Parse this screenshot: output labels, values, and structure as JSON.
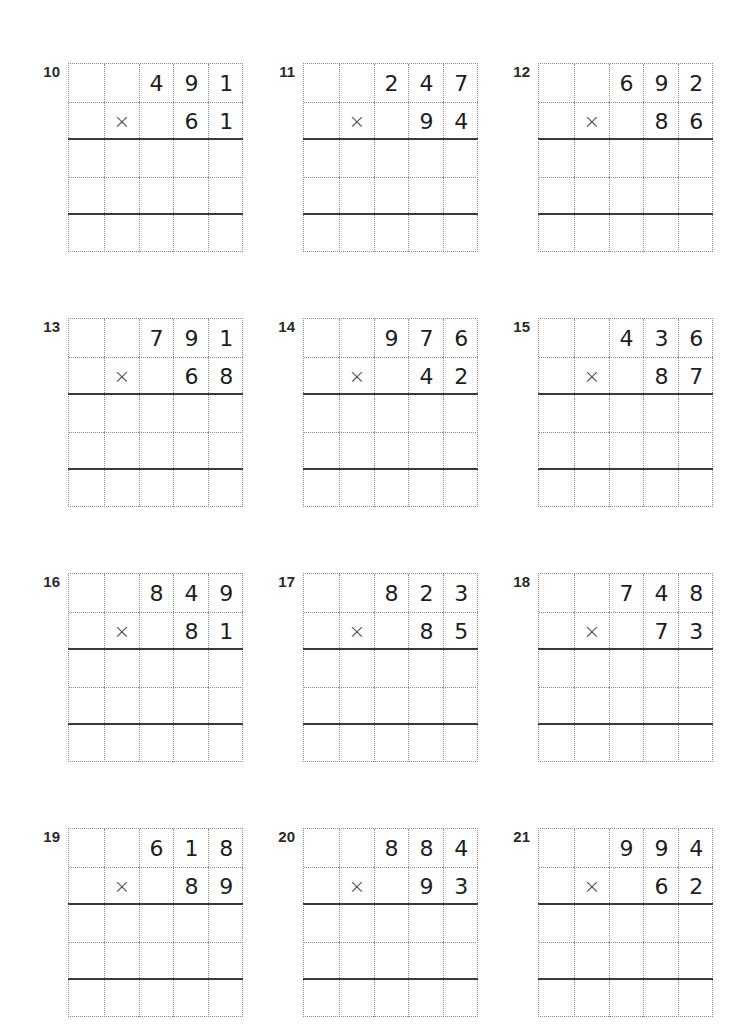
{
  "worksheet": {
    "operator_symbol": "×",
    "grid": {
      "columns": 5,
      "rows": 5,
      "solid_line_after_rows": [
        2,
        4
      ]
    },
    "problems": [
      {
        "number": "10",
        "multiplicand": [
          "4",
          "9",
          "1"
        ],
        "multiplier": [
          "6",
          "1"
        ]
      },
      {
        "number": "11",
        "multiplicand": [
          "2",
          "4",
          "7"
        ],
        "multiplier": [
          "9",
          "4"
        ]
      },
      {
        "number": "12",
        "multiplicand": [
          "6",
          "9",
          "2"
        ],
        "multiplier": [
          "8",
          "6"
        ]
      },
      {
        "number": "13",
        "multiplicand": [
          "7",
          "9",
          "1"
        ],
        "multiplier": [
          "6",
          "8"
        ]
      },
      {
        "number": "14",
        "multiplicand": [
          "9",
          "7",
          "6"
        ],
        "multiplier": [
          "4",
          "2"
        ]
      },
      {
        "number": "15",
        "multiplicand": [
          "4",
          "3",
          "6"
        ],
        "multiplier": [
          "8",
          "7"
        ]
      },
      {
        "number": "16",
        "multiplicand": [
          "8",
          "4",
          "9"
        ],
        "multiplier": [
          "8",
          "1"
        ]
      },
      {
        "number": "17",
        "multiplicand": [
          "8",
          "2",
          "3"
        ],
        "multiplier": [
          "8",
          "5"
        ]
      },
      {
        "number": "18",
        "multiplicand": [
          "7",
          "4",
          "8"
        ],
        "multiplier": [
          "7",
          "3"
        ]
      },
      {
        "number": "19",
        "multiplicand": [
          "6",
          "1",
          "8"
        ],
        "multiplier": [
          "8",
          "9"
        ]
      },
      {
        "number": "20",
        "multiplicand": [
          "8",
          "8",
          "4"
        ],
        "multiplier": [
          "9",
          "3"
        ]
      },
      {
        "number": "21",
        "multiplicand": [
          "9",
          "9",
          "4"
        ],
        "multiplier": [
          "6",
          "2"
        ]
      }
    ]
  }
}
